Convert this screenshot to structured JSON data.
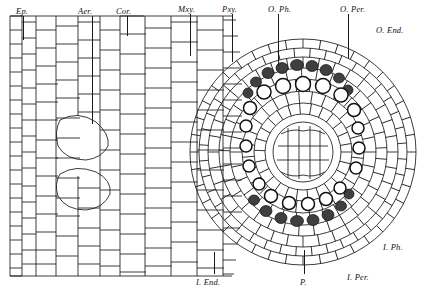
{
  "figure": {
    "style": {
      "line_color": "#1a1a1a",
      "background": "#ffffff",
      "fill_dark": "#3a3a3a"
    },
    "labels": [
      {
        "id": "ep",
        "text": "Ep.",
        "x": 16,
        "y": 6,
        "leader": {
          "x": 23,
          "y": 16,
          "h": 24
        }
      },
      {
        "id": "aer",
        "text": "Aer.",
        "x": 78,
        "y": 6,
        "leader": {
          "x": 92,
          "y": 16,
          "h": 108
        }
      },
      {
        "id": "cor",
        "text": "Cor.",
        "x": 116,
        "y": 6,
        "leader": {
          "x": 127,
          "y": 16,
          "h": 20
        }
      },
      {
        "id": "mxy",
        "text": "Mxy.",
        "x": 178,
        "y": 4,
        "leader": {
          "x": 190,
          "y": 14,
          "h": 42
        }
      },
      {
        "id": "pxy",
        "text": "Pxy.",
        "x": 222,
        "y": 4,
        "leader": {
          "x": 232,
          "y": 14,
          "h": 48
        }
      },
      {
        "id": "o_ph",
        "text": "O. Ph.",
        "x": 268,
        "y": 4,
        "leader": {
          "x": 278,
          "y": 14,
          "h": 52
        }
      },
      {
        "id": "o_per",
        "text": "O. Per.",
        "x": 340,
        "y": 4,
        "leader": {
          "x": 348,
          "y": 14,
          "h": 44
        }
      },
      {
        "id": "o_end",
        "text": "O. End.",
        "x": 376,
        "y": 25,
        "leader": null
      },
      {
        "id": "i_ph",
        "text": "I. Ph.",
        "x": 383,
        "y": 242,
        "leader": null
      },
      {
        "id": "i_per",
        "text": "I. Per.",
        "x": 347,
        "y": 272,
        "leader": null
      },
      {
        "id": "i_end",
        "text": "I. End.",
        "x": 196,
        "y": 277,
        "leader": {
          "x": 214,
          "y": 252,
          "h": 22
        }
      },
      {
        "id": "p",
        "text": "P.",
        "x": 300,
        "y": 277,
        "leader": {
          "x": 304,
          "y": 250,
          "h": 24
        }
      }
    ],
    "legend_meaning": {
      "Ep.": "Epidermis",
      "Aer.": "Aerenchyma",
      "Cor.": "Cortex",
      "Mxy.": "Metaxylem",
      "Pxy.": "Protoxylem",
      "O. Ph.": "Outer phloem",
      "O. Per.": "Outer pericycle",
      "O. End.": "Outer endodermis",
      "I. Ph.": "Inner phloem",
      "I. Per.": "Inner pericycle",
      "I. End.": "Inner endodermis",
      "P.": "Pith"
    }
  }
}
